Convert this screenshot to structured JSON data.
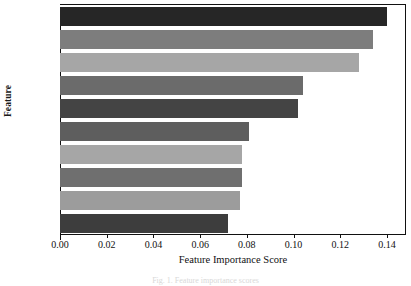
{
  "chart_data": {
    "type": "bar",
    "orientation": "horizontal",
    "title": "",
    "xlabel": "Feature Importance Score",
    "ylabel": "Feature",
    "categories": [
      "P_min",
      "P_max",
      "P_avg",
      "V_max",
      "V_min",
      "V_avg",
      "P_std",
      "V_std",
      "P_poc",
      "V_poc"
    ],
    "values": [
      0.14,
      0.134,
      0.128,
      0.104,
      0.102,
      0.081,
      0.078,
      0.078,
      0.077,
      0.072
    ],
    "bar_colors": [
      "#262626",
      "#7d7d7d",
      "#a6a6a6",
      "#6b6b6b",
      "#444444",
      "#5e5e5e",
      "#a6a6a6",
      "#6f6f6f",
      "#9c9c9c",
      "#3d3d3d"
    ],
    "xlim": [
      0.0,
      0.1477
    ],
    "ylim": [
      0,
      10
    ],
    "xticks": [
      "0.00",
      "0.02",
      "0.04",
      "0.06",
      "0.08",
      "0.10",
      "0.12",
      "0.14"
    ],
    "xtick_values": [
      0.0,
      0.02,
      0.04,
      0.06,
      0.08,
      0.1,
      0.12,
      0.14
    ],
    "grid": false,
    "legend": null
  },
  "caption": {
    "text": "Fig. 1.  Feature importance scores"
  },
  "axis": {
    "x_title": "Feature Importance Score",
    "y_title": "Feature"
  }
}
